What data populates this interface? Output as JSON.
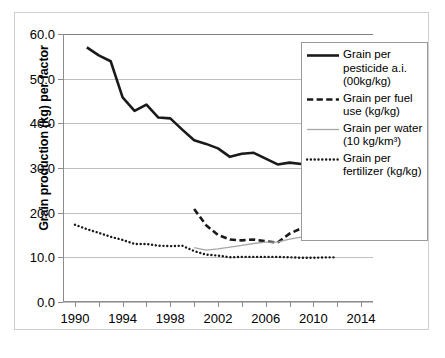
{
  "chart_data": {
    "type": "line",
    "title": "",
    "xlabel": "",
    "ylabel": "Grain production (kg) per factor",
    "xlim": [
      1989,
      2015
    ],
    "ylim": [
      0.0,
      60.0
    ],
    "ytick_step": 10.0,
    "ytick_labels": [
      "60.0",
      "50.0",
      "40.0",
      "30.0",
      "20.0",
      "10.0",
      "0.0"
    ],
    "ytick_values": [
      60.0,
      50.0,
      40.0,
      30.0,
      20.0,
      10.0,
      0.0
    ],
    "xtick_labels": [
      "1990",
      "1994",
      "1998",
      "2002",
      "2006",
      "2010",
      "2014"
    ],
    "xtick_values": [
      1990,
      1994,
      1998,
      2002,
      2006,
      2010,
      2014
    ],
    "xtick_minor_values": [
      1992,
      1996,
      2000,
      2004,
      2008,
      2012
    ],
    "grid": "horizontal",
    "legend_position": "upper-right-inside",
    "series": [
      {
        "name": "Grain per pesticide a.i. (00kg/kg)",
        "style": "solid",
        "color": "#1a1a1a",
        "width": 2.6,
        "x": [
          1991,
          1992,
          1993,
          1994,
          1995,
          1996,
          1997,
          1998,
          1999,
          2000,
          2001,
          2002,
          2003,
          2004,
          2005,
          2006,
          2007,
          2008,
          2009,
          2010,
          2011,
          2012
        ],
        "values": [
          57.0,
          55.2,
          53.9,
          45.8,
          42.8,
          44.2,
          41.3,
          41.1,
          38.6,
          36.2,
          35.4,
          34.4,
          32.5,
          33.2,
          33.4,
          32.1,
          30.8,
          31.2,
          30.9,
          30.8,
          31.3,
          32.5
        ]
      },
      {
        "name": "Grain per fuel use (kg/kg)",
        "style": "dashed",
        "color": "#1a1a1a",
        "width": 2.6,
        "x": [
          2000,
          2001,
          2002,
          2003,
          2004,
          2005,
          2006,
          2007,
          2008,
          2009,
          2010,
          2011,
          2012
        ],
        "values": [
          20.8,
          17.2,
          15.0,
          14.0,
          13.8,
          14.0,
          13.6,
          13.3,
          15.3,
          16.5,
          15.6,
          15.4,
          17.4
        ]
      },
      {
        "name": "Grain per water (10 kg/km³)",
        "style": "solid",
        "color": "#a6a6a6",
        "width": 1.3,
        "x": [
          2000,
          2001,
          2002,
          2003,
          2004,
          2005,
          2006,
          2007,
          2008,
          2009,
          2010,
          2011,
          2012
        ],
        "values": [
          12.2,
          11.6,
          11.9,
          12.3,
          12.7,
          13.1,
          13.4,
          13.4,
          14.1,
          14.5,
          14.8,
          15.2,
          15.2
        ]
      },
      {
        "name": "Grain per fertilizer (kg/kg)",
        "style": "dotted",
        "color": "#1a1a1a",
        "width": 2.4,
        "x": [
          1990,
          1991,
          1992,
          1993,
          1994,
          1995,
          1996,
          1997,
          1998,
          1999,
          2000,
          2001,
          2002,
          2003,
          2004,
          2005,
          2006,
          2007,
          2008,
          2009,
          2010,
          2011,
          2012
        ],
        "values": [
          17.3,
          16.3,
          15.5,
          14.6,
          13.9,
          13.0,
          13.0,
          12.6,
          12.5,
          12.6,
          11.4,
          10.6,
          10.4,
          10.0,
          10.1,
          10.1,
          10.1,
          10.1,
          10.0,
          9.9,
          9.9,
          10.0,
          10.0
        ]
      }
    ]
  },
  "legend": {
    "entries": [
      {
        "label": "Grain per pesticide a.i. (00kg/kg)",
        "style": "solid",
        "color": "#1a1a1a",
        "width": 2.6
      },
      {
        "label": "Grain per fuel use (kg/kg)",
        "style": "dashed",
        "color": "#1a1a1a",
        "width": 2.6
      },
      {
        "label": "Grain per water (10 kg/km³)",
        "style": "solid",
        "color": "#a6a6a6",
        "width": 1.3
      },
      {
        "label": "Grain per fertilizer (kg/kg)",
        "style": "dotted",
        "color": "#1a1a1a",
        "width": 2.4
      }
    ]
  },
  "colors": {
    "grid": "#bfbfbf",
    "axis": "#8c8c8c",
    "frame": "#cfcfcf",
    "legend_border": "#9a9a9a",
    "text": "#000000"
  }
}
